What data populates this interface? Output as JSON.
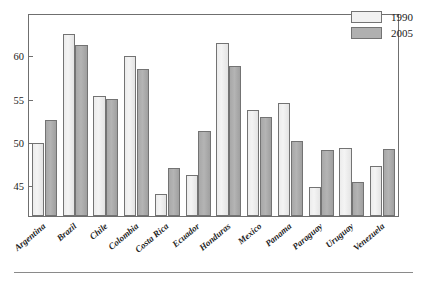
{
  "chart_data": {
    "type": "bar",
    "title": "",
    "subtitle": "",
    "xlabel": "",
    "ylabel": "",
    "categories": [
      "Argentina",
      "Brazil",
      "Chile",
      "Colombia",
      "Costa Rica",
      "Ecuador",
      "Honduras",
      "Mexico",
      "Panama",
      "Paraguay",
      "Uruguay",
      "Venezuela"
    ],
    "series": [
      {
        "name": "1990",
        "color": "#f1f1f1",
        "values": [
          50.0,
          62.6,
          55.4,
          60.1,
          44.0,
          46.2,
          61.6,
          53.8,
          54.6,
          44.9,
          49.4,
          47.3
        ]
      },
      {
        "name": "2005",
        "color": "#b0b0b0",
        "values": [
          52.6,
          61.3,
          55.1,
          58.5,
          47.1,
          51.4,
          58.9,
          53.0,
          50.2,
          49.2,
          45.4,
          49.3
        ]
      }
    ],
    "yticks": [
      45,
      50,
      55,
      60
    ],
    "ytick_labels": [
      "45",
      "50",
      "55",
      "60"
    ],
    "ylim": [
      41.5,
      64.8
    ],
    "grid": false,
    "legend_position": "top-right",
    "bar_border_color": "#737373",
    "frame_color": "#6f6f6f"
  },
  "legend": {
    "items": [
      {
        "label": "1990"
      },
      {
        "label": "2005"
      }
    ]
  },
  "footer": {
    "rule": ""
  }
}
